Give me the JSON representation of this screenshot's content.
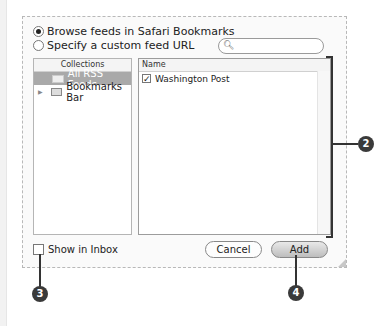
{
  "source": {
    "browse_label": "Browse feeds in Safari Bookmarks",
    "custom_label": "Specify a custom feed URL",
    "search_placeholder": ""
  },
  "collections": {
    "header": "Collections",
    "items": [
      {
        "label": "All RSS Feeds",
        "selected": true
      },
      {
        "label": "Bookmarks Bar",
        "selected": false
      }
    ]
  },
  "names": {
    "header": "Name",
    "rows": [
      {
        "label": "Washington Post",
        "checked": true
      }
    ]
  },
  "footer": {
    "show_in_inbox": "Show in Inbox",
    "cancel": "Cancel",
    "add": "Add"
  },
  "callouts": {
    "two": "2",
    "three": "3",
    "four": "4"
  }
}
